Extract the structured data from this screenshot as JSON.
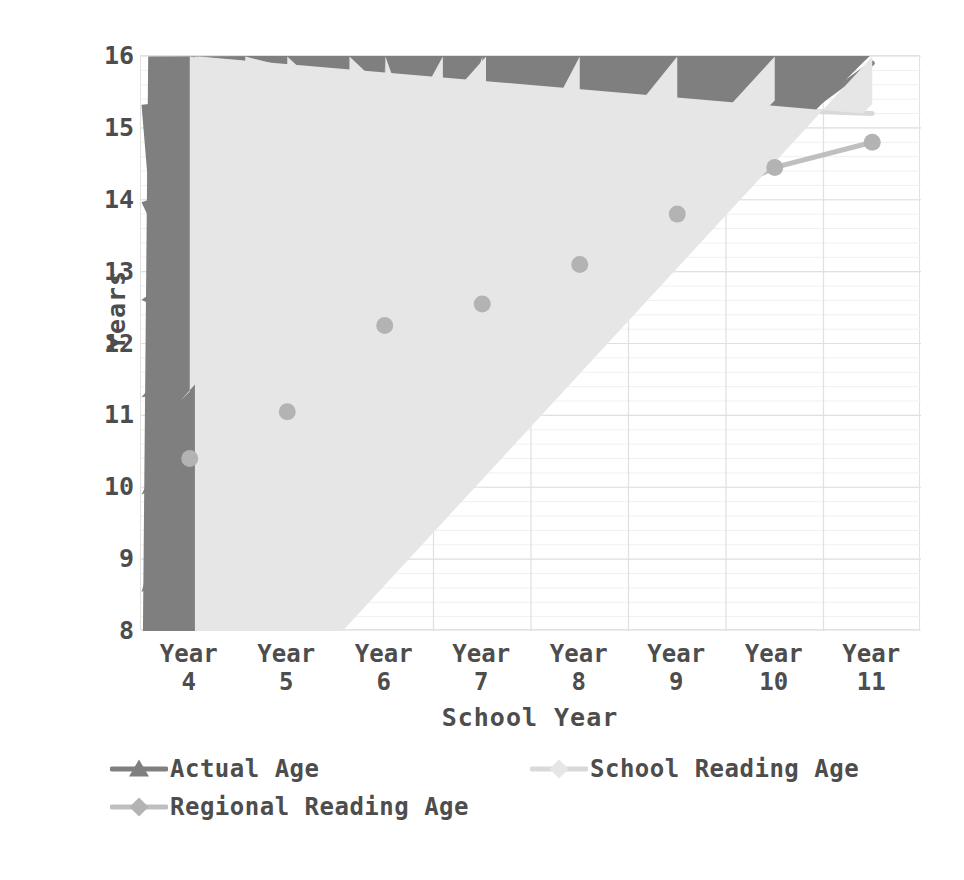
{
  "chart_data": {
    "type": "line",
    "title": "",
    "xlabel": "School Year",
    "ylabel": "Years",
    "categories": [
      "Year 4",
      "Year 5",
      "Year 6",
      "Year 7",
      "Year 8",
      "Year 9",
      "Year 10",
      "Year 11"
    ],
    "category_lines": [
      [
        "Year",
        "4"
      ],
      [
        "Year",
        "5"
      ],
      [
        "Year",
        "6"
      ],
      [
        "Year",
        "7"
      ],
      [
        "Year",
        "8"
      ],
      [
        "Year",
        "9"
      ],
      [
        "Year",
        "10"
      ],
      [
        "Year",
        "11"
      ]
    ],
    "ylim": [
      8,
      16
    ],
    "yticks": [
      8,
      9,
      10,
      11,
      12,
      13,
      14,
      15,
      16
    ],
    "ytick_labels": [
      "8",
      "9",
      "10",
      "11",
      "12",
      "13",
      "14",
      "15",
      "16"
    ],
    "y_minor_step": 0.2,
    "grid": {
      "horizontal_major": true,
      "horizontal_minor": true,
      "vertical_major": true
    },
    "legend_position": "bottom",
    "series": [
      {
        "name": "Actual Age",
        "color": "#808080",
        "marker": "triangle",
        "marker_color": "#7f7f7f",
        "values": [
          8.95,
          9.95,
          10.95,
          11.9,
          12.9,
          13.9,
          14.9,
          15.9
        ]
      },
      {
        "name": "School Reading Age",
        "color": "#d9d9d9",
        "marker": "diamond",
        "marker_color": "#e6e6e6",
        "values": [
          11.2,
          11.8,
          12.6,
          12.6,
          13.1,
          14.55,
          15.25,
          15.2
        ]
      },
      {
        "name": "Regional Reading Age",
        "color": "#bfbfbf",
        "marker": "circle",
        "marker_color": "#b3b3b3",
        "values": [
          10.4,
          11.05,
          12.25,
          12.55,
          13.1,
          13.8,
          14.45,
          14.8
        ]
      }
    ]
  },
  "colors": {
    "axis_text": "#4d4d4d",
    "grid_major": "#e0e0e0",
    "grid_minor": "#f0f0f0",
    "plot_border": "#e2e2e2",
    "background": "#ffffff"
  },
  "legend": {
    "items": [
      {
        "label": "Actual Age"
      },
      {
        "label": "School Reading Age"
      },
      {
        "label": "Regional Reading Age"
      }
    ]
  }
}
